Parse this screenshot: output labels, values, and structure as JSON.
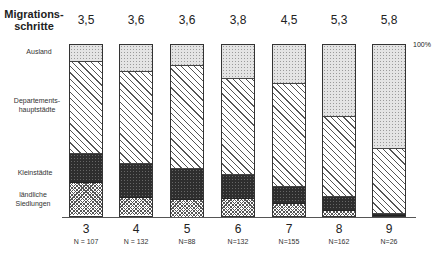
{
  "header": {
    "row_label_line1": "Migrations-",
    "row_label_line2": "schritte",
    "top_values": [
      "3,5",
      "3,6",
      "3,6",
      "3,8",
      "4,5",
      "5,3",
      "5,8"
    ],
    "pct_marker": "100%"
  },
  "legend": {
    "ausland": "Ausland",
    "dept_line1": "Departements-",
    "dept_line2": "hauptstädte",
    "klein": "Kleinstädte",
    "rural_line1": "ländliche",
    "rural_line2": "Siedlungen"
  },
  "x_labels": [
    "3",
    "4",
    "5",
    "6",
    "7",
    "8",
    "9"
  ],
  "n_labels": [
    "N = 107",
    "N = 132",
    "N=88",
    "N=132",
    "N=155",
    "N=162",
    "N=26"
  ],
  "colors": {
    "ausland": "#e4e4e4",
    "dept": "#ffffff",
    "klein": "#2e2e2e",
    "rural": "#cccccc",
    "border": "#333333"
  },
  "chart_data": {
    "type": "bar",
    "stacked": true,
    "percent": true,
    "title": "",
    "xlabel": "",
    "ylabel": "",
    "ylim": [
      0,
      100
    ],
    "categories": [
      "3",
      "4",
      "5",
      "6",
      "7",
      "8",
      "9"
    ],
    "category_n": [
      107,
      132,
      88,
      132,
      155,
      162,
      26
    ],
    "top_row_label": "Migrationsschritte",
    "top_row_values": [
      3.5,
      3.6,
      3.6,
      3.8,
      4.5,
      5.3,
      5.8
    ],
    "series": [
      {
        "name": "ländliche Siedlungen",
        "values": [
          19,
          10,
          10,
          10,
          7,
          3,
          0
        ]
      },
      {
        "name": "Kleinstädte",
        "values": [
          17,
          20,
          18,
          14,
          10,
          8,
          1
        ]
      },
      {
        "name": "Departementshauptstädte",
        "values": [
          54,
          54,
          60,
          56,
          60,
          47,
          38
        ]
      },
      {
        "name": "Ausland",
        "values": [
          10,
          16,
          12,
          20,
          23,
          42,
          61
        ]
      }
    ],
    "annotations": [
      "100%"
    ],
    "grid": false,
    "legend_position": "left"
  }
}
